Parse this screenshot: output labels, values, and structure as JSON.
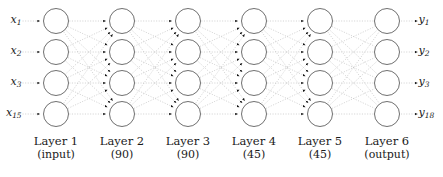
{
  "figure": {
    "background_color": "#ffffff",
    "node_stroke_color": "#555555",
    "node_fill_color": "#ffffff",
    "edge_color": "#b9b9b9",
    "arrow_color": "#111111",
    "text_color": "#1a1a1a"
  },
  "inputs": [
    {
      "name": "x1",
      "base": "x",
      "sub": "1"
    },
    {
      "name": "x2",
      "base": "x",
      "sub": "2"
    },
    {
      "name": "x3",
      "base": "x",
      "sub": "3"
    },
    {
      "name": "x15",
      "base": "x",
      "sub": "15"
    }
  ],
  "outputs": [
    {
      "name": "y1",
      "base": "y",
      "sub": "1"
    },
    {
      "name": "y2",
      "base": "y",
      "sub": "2"
    },
    {
      "name": "y3",
      "base": "y",
      "sub": "3"
    },
    {
      "name": "y18",
      "base": "y",
      "sub": "18"
    }
  ],
  "layers": [
    {
      "index": 1,
      "title": "Layer 1",
      "subtitle": "(input)",
      "nodes_drawn": 4,
      "cx": 56
    },
    {
      "index": 2,
      "title": "Layer 2",
      "subtitle": "(90)",
      "nodes_drawn": 4,
      "cx": 122
    },
    {
      "index": 3,
      "title": "Layer 3",
      "subtitle": "(90)",
      "nodes_drawn": 4,
      "cx": 188
    },
    {
      "index": 4,
      "title": "Layer 4",
      "subtitle": "(45)",
      "nodes_drawn": 4,
      "cx": 254
    },
    {
      "index": 5,
      "title": "Layer 5",
      "subtitle": "(45)",
      "nodes_drawn": 4,
      "cx": 320
    },
    {
      "index": 6,
      "title": "Layer 6",
      "subtitle": "(output)",
      "nodes_drawn": 4,
      "cx": 387
    }
  ],
  "geometry": {
    "node_rows_y": [
      21,
      52,
      83,
      114
    ],
    "node_radius": 12.5,
    "caption_top": 134,
    "width": 443,
    "height": 177
  }
}
